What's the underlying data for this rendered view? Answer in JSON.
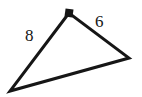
{
  "figure": {
    "type": "geometry-diagram",
    "shape": "right-triangle",
    "background_color": "#ffffff",
    "stroke_color": "#161616",
    "stroke_width": 3,
    "vertices": {
      "apex": {
        "x": 69,
        "y": 13,
        "label": "right-angle vertex"
      },
      "bottom_left": {
        "x": 10,
        "y": 91,
        "label": "lower-left vertex"
      },
      "right": {
        "x": 129,
        "y": 58,
        "label": "right vertex"
      }
    },
    "right_angle_marker": {
      "at_vertex": "apex",
      "style": "filled-square",
      "size": 8,
      "center_x": 69,
      "center_y": 13,
      "color": "#161616"
    },
    "side_labels": [
      {
        "name": "left-side-length",
        "text": "8",
        "side": "apex-to-bottom-left",
        "x": 25,
        "y": 27
      },
      {
        "name": "right-side-length",
        "text": "6",
        "side": "apex-to-right",
        "x": 95,
        "y": 13
      }
    ],
    "label_color": "#161616",
    "label_font_size": "17px"
  }
}
